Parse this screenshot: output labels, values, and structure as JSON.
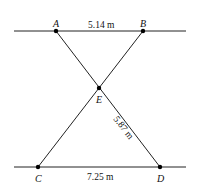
{
  "diagram": {
    "type": "geometry",
    "points": {
      "A": {
        "label": "A"
      },
      "B": {
        "label": "B"
      },
      "C": {
        "label": "C"
      },
      "D": {
        "label": "D"
      },
      "E": {
        "label": "E"
      }
    },
    "measurements": {
      "AB": "5.14 m",
      "ED": "5.87 m",
      "CD": "7.25 m"
    },
    "colors": {
      "line": "#222222",
      "point": "#000000",
      "background": "#ffffff"
    }
  }
}
